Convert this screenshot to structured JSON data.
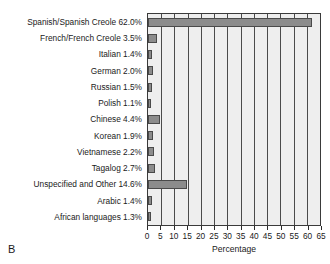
{
  "panel": {
    "letter": "B"
  },
  "chart_data": {
    "type": "bar",
    "orientation": "horizontal",
    "title": "",
    "xlabel": "Percentage",
    "ylabel": "",
    "xlim": [
      0,
      65
    ],
    "xticks": [
      0,
      5,
      10,
      15,
      20,
      25,
      30,
      35,
      40,
      45,
      50,
      55,
      60,
      65
    ],
    "grid": true,
    "legend": false,
    "bar_color": "#8c8c8c",
    "bar_edge_color": "#4a4a4a",
    "plot_background": "#eeeeee",
    "categories": [
      "Spanish/Spanish Creole",
      "French/French Creole",
      "Italian",
      "German",
      "Russian",
      "Polish",
      "Chinese",
      "Korean",
      "Vietnamese",
      "Tagalog",
      "Unspecified and Other",
      "Arabic",
      "African languages"
    ],
    "values": [
      62.0,
      3.5,
      1.4,
      2.0,
      1.5,
      1.1,
      4.4,
      1.9,
      2.2,
      2.7,
      14.6,
      1.4,
      1.3
    ],
    "labels": [
      "Spanish/Spanish Creole 62.0%",
      "French/French Creole 3.5%",
      "Italian 1.4%",
      "German 2.0%",
      "Russian 1.5%",
      "Polish 1.1%",
      "Chinese 4.4%",
      "Korean 1.9%",
      "Vietnamese 2.2%",
      "Tagalog 2.7%",
      "Unspecified and Other 14.6%",
      "Arabic 1.4%",
      "African languages 1.3%"
    ]
  }
}
